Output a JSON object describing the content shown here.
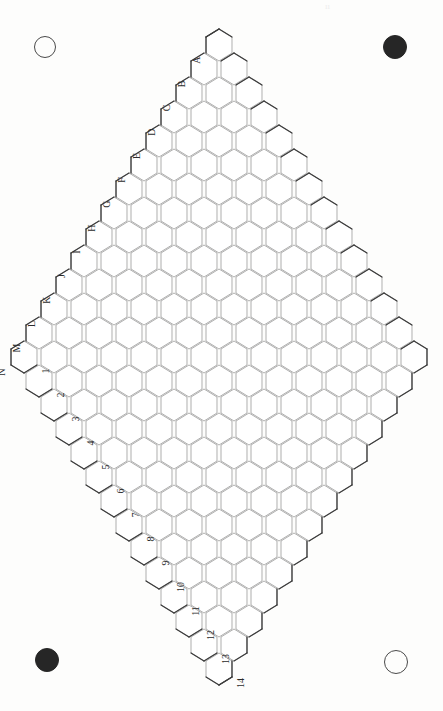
{
  "board": {
    "type": "hex-rhombus-grid",
    "kind": "hex-game-board",
    "size": 14,
    "rows": 14,
    "cols": 14,
    "orientation": "pointy-top",
    "rotation_degrees": 90,
    "hex_width": 30,
    "hex_height": 32,
    "line_color_inner": "#9a9a9a",
    "line_color_outer": "#3c3c3c",
    "fill_color": "#ffffff",
    "background_color": "#fdfdfc",
    "apex_top": {
      "x": 219,
      "y": 45
    },
    "apex_bottom": {
      "x": 222,
      "y": 665
    },
    "apex_left": {
      "x": 48,
      "y": 358
    },
    "apex_right": {
      "x": 397,
      "y": 356
    },
    "widest_row_cells": 27
  },
  "labels": {
    "letters": [
      "A",
      "B",
      "C",
      "D",
      "E",
      "F",
      "G",
      "H",
      "I",
      "J",
      "K",
      "L",
      "M",
      "N"
    ],
    "numbers": [
      "1",
      "2",
      "3",
      "4",
      "5",
      "6",
      "7",
      "8",
      "9",
      "10",
      "11",
      "12",
      "13",
      "14"
    ],
    "letter_edge": "lower-left",
    "number_edge": "lower-right",
    "text_color": "#2b2b2b",
    "rotation_degrees": -90
  },
  "corner_markers": [
    {
      "id": "top-left",
      "style": "open",
      "x": 45,
      "y": 47,
      "radius": 11,
      "color": "#4a4a4a"
    },
    {
      "id": "top-right",
      "style": "filled",
      "x": 395,
      "y": 47,
      "radius": 12,
      "color": "#262626"
    },
    {
      "id": "bottom-left",
      "style": "filled",
      "x": 47,
      "y": 660,
      "radius": 12,
      "color": "#262626"
    },
    {
      "id": "bottom-right",
      "style": "open",
      "x": 396,
      "y": 662,
      "radius": 12,
      "color": "#4a4a4a"
    }
  ],
  "top_artifact": {
    "text": "ıı",
    "x": 325,
    "y": 1,
    "color": "#ededed"
  },
  "page": {
    "width": 443,
    "height": 711
  }
}
